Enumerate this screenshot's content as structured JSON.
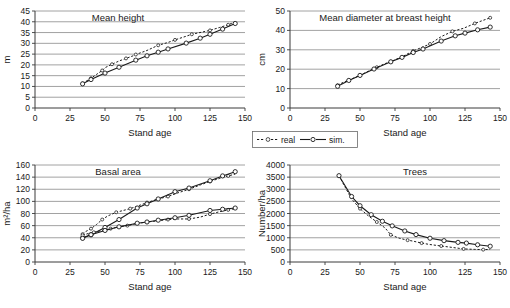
{
  "figure": {
    "panel_count": 4,
    "shared_xlabel": "Stand age",
    "legend": {
      "position": "below-top-right-panel",
      "entries": [
        {
          "label": "real",
          "style": "dashed-open-circle",
          "marker": "circle",
          "color": "#1a1a1a"
        },
        {
          "label": "sim.",
          "style": "solid-open-circle",
          "marker": "circle",
          "color": "#1a1a1a"
        }
      ]
    }
  },
  "chart_data": [
    {
      "id": "mean-height",
      "type": "line",
      "title": "Mean height",
      "xlabel": "Stand age",
      "ylabel": "m",
      "xlim": [
        0,
        150
      ],
      "ylim": [
        0,
        45
      ],
      "xticks": [
        0,
        25,
        50,
        75,
        100,
        125,
        150
      ],
      "yticks": [
        0,
        5,
        10,
        15,
        20,
        25,
        30,
        35,
        40,
        45
      ],
      "grid": true,
      "series": [
        {
          "name": "real",
          "x": [
            34,
            36,
            40,
            44,
            48,
            50,
            55,
            60,
            65,
            70,
            72,
            80,
            88,
            95,
            100,
            108,
            112,
            120,
            125,
            132,
            138,
            143
          ],
          "y": [
            11.4,
            12.2,
            13.8,
            15.6,
            17.4,
            18.7,
            20.3,
            21.8,
            23.0,
            24.2,
            24.8,
            26.7,
            29.1,
            30.4,
            31.6,
            33.3,
            34.2,
            35.3,
            36.0,
            37.4,
            38.6,
            40.0
          ]
        },
        {
          "name": "sim.",
          "x": [
            34,
            40,
            50,
            60,
            72,
            80,
            88,
            95,
            108,
            118,
            125,
            134,
            143
          ],
          "y": [
            11.2,
            13.2,
            16.2,
            18.9,
            22.2,
            24.2,
            25.9,
            27.4,
            30.1,
            32.4,
            34.2,
            36.6,
            39.2
          ]
        }
      ]
    },
    {
      "id": "mean-diameter-breast-height",
      "type": "line",
      "title": "Mean diameter at breast height",
      "xlabel": "Stand age",
      "ylabel": "cm",
      "xlim": [
        0,
        150
      ],
      "ylim": [
        0,
        50
      ],
      "xticks": [
        0,
        25,
        50,
        75,
        100,
        125,
        150
      ],
      "yticks": [
        0,
        10,
        20,
        30,
        40,
        50
      ],
      "grid": true,
      "series": [
        {
          "name": "real",
          "x": [
            34,
            38,
            42,
            46,
            50,
            56,
            62,
            68,
            72,
            80,
            88,
            94,
            100,
            108,
            116,
            124,
            132,
            138,
            143
          ],
          "y": [
            11.8,
            13.2,
            14.4,
            15.6,
            16.8,
            19.0,
            21.0,
            22.9,
            23.9,
            26.4,
            29.4,
            31.2,
            33.0,
            36.8,
            39.5,
            41.1,
            43.6,
            45.2,
            46.5
          ]
        },
        {
          "name": "sim.",
          "x": [
            34,
            42,
            50,
            60,
            72,
            80,
            88,
            95,
            108,
            118,
            125,
            134,
            143
          ],
          "y": [
            11.2,
            14.2,
            16.8,
            20.1,
            23.8,
            26.1,
            28.6,
            30.4,
            34.5,
            37.2,
            38.6,
            40.3,
            41.7
          ]
        }
      ]
    },
    {
      "id": "basal-area",
      "type": "line",
      "title": "Basal area",
      "xlabel": "Stand age",
      "ylabel": "m²/ha",
      "xlim": [
        0,
        150
      ],
      "ylim": [
        0,
        160
      ],
      "xticks": [
        0,
        25,
        50,
        75,
        100,
        125,
        150
      ],
      "yticks": [
        0,
        20,
        40,
        60,
        80,
        100,
        120,
        140,
        160
      ],
      "grid": true,
      "series": [
        {
          "name": "real-upper",
          "x": [
            34,
            36,
            40,
            44,
            48,
            52,
            58,
            63,
            68,
            73,
            80,
            88,
            95,
            102,
            110,
            118,
            125,
            132,
            138,
            143
          ],
          "y": [
            46,
            50,
            55,
            62,
            70,
            76,
            82,
            85,
            88,
            92,
            98,
            104,
            108,
            114,
            120,
            127,
            133,
            138,
            142,
            145
          ]
        },
        {
          "name": "sim.-upper",
          "x": [
            34,
            40,
            50,
            60,
            73,
            80,
            88,
            100,
            110,
            125,
            134,
            143
          ],
          "y": [
            40,
            45,
            57,
            70,
            89,
            96,
            104,
            116,
            122,
            134,
            142,
            149
          ]
        },
        {
          "name": "real-lower",
          "x": [
            34,
            38,
            42,
            48,
            54,
            60,
            66,
            72,
            80,
            88,
            95,
            102,
            110,
            118,
            125,
            132,
            138,
            143
          ],
          "y": [
            44,
            47,
            49,
            52,
            55,
            58,
            60,
            63,
            66,
            68,
            70,
            71,
            71,
            74,
            79,
            83,
            86,
            88
          ]
        },
        {
          "name": "sim.-lower",
          "x": [
            34,
            40,
            50,
            60,
            73,
            80,
            88,
            100,
            110,
            125,
            134,
            143
          ],
          "y": [
            39,
            45,
            52,
            58,
            64,
            66,
            69,
            73,
            77,
            85,
            87,
            89
          ]
        }
      ]
    },
    {
      "id": "trees",
      "type": "line",
      "title": "Trees",
      "xlabel": "Stand age",
      "ylabel": "Number/ha",
      "xlim": [
        0,
        150
      ],
      "ylim": [
        0,
        4000
      ],
      "xticks": [
        0,
        25,
        50,
        75,
        100,
        125,
        150
      ],
      "yticks": [
        0,
        500,
        1000,
        1500,
        2000,
        2500,
        3000,
        3500,
        4000
      ],
      "grid": true,
      "series": [
        {
          "name": "real",
          "x": [
            35,
            44,
            50,
            56,
            62,
            68,
            72,
            78,
            84,
            88,
            94,
            100,
            108,
            116,
            124,
            132,
            138,
            143
          ],
          "y": [
            3550,
            2600,
            2200,
            1900,
            1650,
            1400,
            1120,
            980,
            900,
            860,
            780,
            720,
            660,
            600,
            540,
            520,
            510,
            520
          ]
        },
        {
          "name": "sim.",
          "x": [
            35,
            44,
            50,
            58,
            66,
            73,
            82,
            90,
            100,
            110,
            120,
            126,
            134,
            143
          ],
          "y": [
            3560,
            2700,
            2320,
            1950,
            1680,
            1490,
            1280,
            1130,
            980,
            880,
            810,
            780,
            710,
            650
          ]
        }
      ]
    }
  ]
}
